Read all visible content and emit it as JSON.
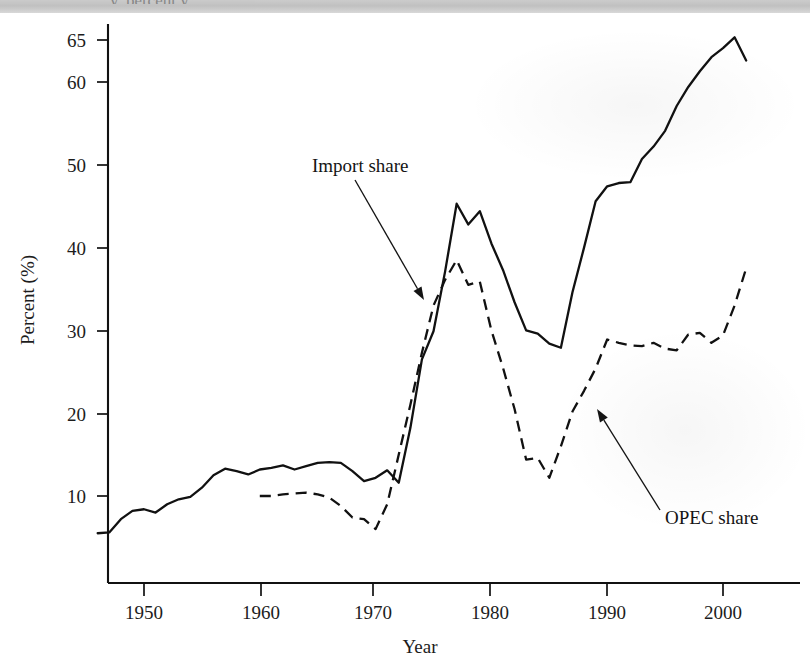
{
  "page": {
    "background_color": "#ffffff",
    "ink_color": "#111111",
    "top_band": {
      "visible": true,
      "clipped_caption": "y, percent y"
    }
  },
  "chart_data": {
    "type": "line",
    "title": "",
    "xlabel": "Year",
    "ylabel": "Percent (%)",
    "xlim": [
      1946,
      2003
    ],
    "ylim": [
      0,
      67
    ],
    "grid": false,
    "legend": "annotations",
    "x_ticks": [
      1950,
      1960,
      1970,
      1980,
      1990,
      2000
    ],
    "x_tick_labels": [
      "1950",
      "1960",
      "1970",
      "1980",
      "1990",
      "2000"
    ],
    "y_ticks": [
      10,
      20,
      30,
      40,
      50,
      60,
      65
    ],
    "y_tick_labels": [
      "10",
      "20",
      "30",
      "40",
      "50",
      "60",
      "65"
    ],
    "annotations": [
      {
        "label": "Import share",
        "text_x": 312,
        "text_y": 172,
        "arrow_from": [
          355,
          180
        ],
        "arrow_to": [
          424,
          300
        ]
      },
      {
        "label": "OPEC share",
        "text_x": 665,
        "text_y": 524,
        "arrow_from": [
          660,
          510
        ],
        "arrow_to": [
          597,
          409
        ]
      }
    ],
    "series": [
      {
        "name": "Import share",
        "style": "solid",
        "x": [
          1946,
          1947,
          1948,
          1949,
          1950,
          1951,
          1952,
          1953,
          1954,
          1955,
          1956,
          1957,
          1958,
          1959,
          1960,
          1961,
          1962,
          1963,
          1964,
          1965,
          1966,
          1967,
          1968,
          1969,
          1970,
          1971,
          1972,
          1973,
          1974,
          1975,
          1976,
          1977,
          1978,
          1979,
          1980,
          1981,
          1982,
          1983,
          1984,
          1985,
          1986,
          1987,
          1988,
          1989,
          1990,
          1991,
          1992,
          1993,
          1994,
          1995,
          1996,
          1997,
          1998,
          1999,
          2000,
          2001,
          2002
        ],
        "values": [
          5.5,
          5.6,
          7.2,
          8.2,
          8.4,
          8.0,
          9.0,
          9.6,
          9.9,
          11.0,
          12.5,
          13.3,
          13.0,
          12.6,
          13.2,
          13.4,
          13.7,
          13.2,
          13.6,
          14.0,
          14.1,
          14.0,
          13.0,
          11.8,
          12.2,
          13.1,
          11.6,
          18.2,
          26.5,
          29.9,
          37.1,
          45.3,
          42.8,
          44.4,
          40.5,
          37.3,
          33.4,
          30.0,
          29.6,
          28.4,
          27.9,
          34.6,
          40.0,
          45.6,
          47.4,
          47.8,
          47.9,
          50.7,
          52.2,
          54.1,
          57.1,
          59.4,
          61.3,
          63.0,
          64.1,
          65.4,
          62.6
        ]
      },
      {
        "name": "OPEC share",
        "style": "dashed",
        "x": [
          1960,
          1961,
          1962,
          1963,
          1964,
          1965,
          1966,
          1967,
          1968,
          1969,
          1970,
          1971,
          1972,
          1973,
          1974,
          1975,
          1976,
          1977,
          1978,
          1979,
          1980,
          1981,
          1982,
          1983,
          1984,
          1985,
          1986,
          1987,
          1988,
          1989,
          1990,
          1991,
          1992,
          1993,
          1994,
          1995,
          1996,
          1997,
          1998,
          1999,
          2000,
          2001,
          2002
        ],
        "values": [
          10.0,
          10.0,
          10.2,
          10.3,
          10.4,
          10.2,
          9.8,
          8.8,
          7.4,
          7.2,
          6.0,
          9.0,
          15.0,
          21.0,
          27.3,
          33.0,
          36.1,
          38.5,
          35.5,
          35.9,
          30.0,
          25.5,
          20.5,
          14.4,
          14.6,
          12.2,
          16.0,
          20.2,
          22.7,
          25.4,
          28.9,
          28.5,
          28.2,
          28.1,
          28.5,
          27.8,
          27.6,
          29.5,
          29.7,
          28.5,
          29.4,
          33.0,
          37.5
        ]
      }
    ]
  },
  "axes_labels": {
    "y_axis_title": "Percent (%)",
    "x_axis_title": "Year"
  }
}
